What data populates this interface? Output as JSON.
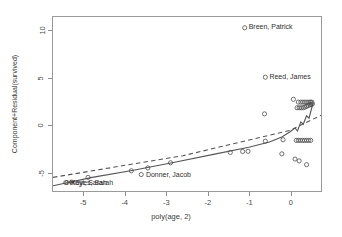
{
  "chart_data": {
    "type": "scatter",
    "title": "",
    "xlabel": "poly(age, 2)",
    "ylabel": "Component+Residual(survived)",
    "xlim": [
      -5.75,
      0.75
    ],
    "ylim": [
      -7.0,
      11.5
    ],
    "xticks": [
      -5,
      -4,
      -3,
      -2,
      -1,
      0
    ],
    "xtick_labels": [
      "-5",
      "-4",
      "-3",
      "-2",
      "-1",
      "0"
    ],
    "yticks": [
      -5,
      0,
      5,
      10
    ],
    "ytick_labels": [
      "-5",
      "0",
      "5",
      "10"
    ],
    "grid": false,
    "legend": "none",
    "point_marker": "open-circle",
    "series": [
      {
        "name": "component+residual points",
        "points": [
          [
            -5.3,
            -6.05
          ],
          [
            -4.9,
            -5.55
          ],
          [
            -3.85,
            -4.85
          ],
          [
            -3.45,
            -4.55
          ],
          [
            -2.9,
            -4.0
          ],
          [
            -1.45,
            -2.9
          ],
          [
            -1.15,
            -2.8
          ],
          [
            -1.02,
            -2.78
          ],
          [
            -0.62,
            1.2
          ],
          [
            -0.6,
            -1.7
          ],
          [
            -0.17,
            -1.55
          ],
          [
            -0.2,
            -3.05
          ],
          [
            0.12,
            -3.6
          ],
          [
            0.22,
            -3.8
          ],
          [
            0.4,
            -4.2
          ],
          [
            0.08,
            2.75
          ],
          [
            0.2,
            2.45
          ],
          [
            0.26,
            2.45
          ],
          [
            0.31,
            2.45
          ],
          [
            0.36,
            2.45
          ],
          [
            0.41,
            2.45
          ],
          [
            0.46,
            2.45
          ],
          [
            0.5,
            2.45
          ],
          [
            0.53,
            2.45
          ],
          [
            0.17,
            1.85
          ],
          [
            0.22,
            1.85
          ],
          [
            0.27,
            1.85
          ],
          [
            0.32,
            1.85
          ],
          [
            0.36,
            1.92
          ],
          [
            0.4,
            2.0
          ],
          [
            0.44,
            2.08
          ],
          [
            0.48,
            2.15
          ],
          [
            0.51,
            2.2
          ],
          [
            0.54,
            2.25
          ],
          [
            0.15,
            -1.62
          ],
          [
            0.2,
            -1.62
          ],
          [
            0.25,
            -1.62
          ],
          [
            0.3,
            -1.62
          ],
          [
            0.35,
            -1.62
          ],
          [
            0.4,
            -1.62
          ],
          [
            0.45,
            -1.62
          ],
          [
            0.5,
            -1.62
          ]
        ]
      }
    ],
    "lines": [
      {
        "name": "linear-reference",
        "style": "dashed",
        "points": [
          [
            -5.75,
            -5.55
          ],
          [
            -2.6,
            -3.25
          ],
          [
            0.0,
            -0.55
          ],
          [
            0.75,
            1.05
          ]
        ]
      },
      {
        "name": "loess-smooth",
        "style": "solid",
        "points": [
          [
            -5.75,
            -6.45
          ],
          [
            -4.8,
            -5.55
          ],
          [
            -3.8,
            -4.8
          ],
          [
            -2.8,
            -3.95
          ],
          [
            -1.8,
            -3.05
          ],
          [
            -1.0,
            -2.35
          ],
          [
            -0.5,
            -1.8
          ],
          [
            -0.2,
            -1.25
          ],
          [
            0.0,
            -0.7
          ],
          [
            0.12,
            -0.3
          ],
          [
            0.18,
            -0.62
          ],
          [
            0.26,
            0.35
          ],
          [
            0.32,
            0.1
          ],
          [
            0.4,
            1.0
          ],
          [
            0.46,
            0.75
          ],
          [
            0.55,
            2.25
          ]
        ]
      }
    ],
    "point_labels": [
      {
        "text": "Breen, Patrick",
        "x": -1.1,
        "y": 10.35,
        "anchor": "start",
        "marker": "trailing"
      },
      {
        "text": "Reed, James",
        "x": -0.6,
        "y": 5.1,
        "anchor": "start",
        "marker": "trailing"
      },
      {
        "text": "Donner, Jacob",
        "x": -3.55,
        "y": -5.25,
        "anchor": "start",
        "marker": "leading"
      },
      {
        "text": "Keyes, Sarah",
        "x": -5.35,
        "y": -6.1,
        "anchor": "start",
        "marker": "leading"
      },
      {
        "text": "Hoyt, Sarah",
        "x": -5.38,
        "y": -6.1,
        "anchor": "start",
        "marker": "leading"
      }
    ]
  }
}
